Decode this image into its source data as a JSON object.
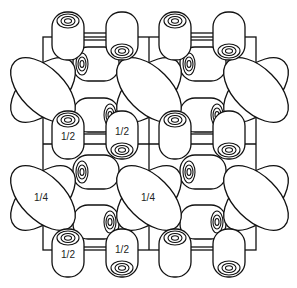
{
  "diagram": {
    "type": "crystal-packing-projection",
    "stroke_color": "#111111",
    "background": "#ffffff",
    "labels": {
      "half": "1/2",
      "quarter": "1/4"
    },
    "label_instances": [
      {
        "text": "1/2",
        "x": 68,
        "y": 131
      },
      {
        "text": "1/2",
        "x": 122,
        "y": 131
      },
      {
        "text": "1/4",
        "x": 41,
        "y": 198
      },
      {
        "text": "1/4",
        "x": 148,
        "y": 198
      },
      {
        "text": "1/2",
        "x": 68,
        "y": 252
      },
      {
        "text": "1/2",
        "x": 122,
        "y": 252
      }
    ]
  }
}
